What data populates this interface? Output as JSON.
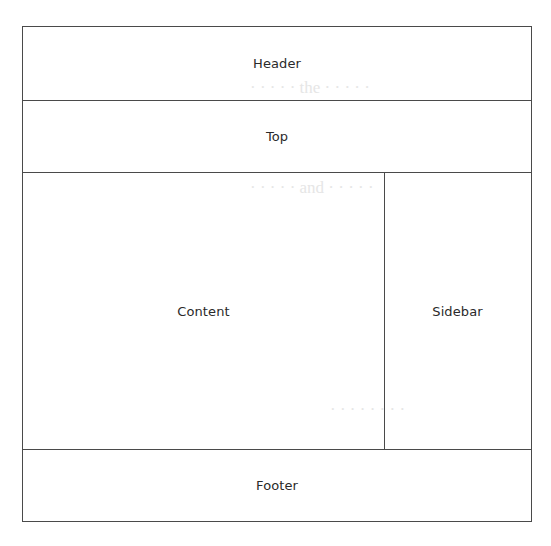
{
  "diagram": {
    "type": "page-layout-wireframe",
    "regions": {
      "header": {
        "label": "Header"
      },
      "top": {
        "label": "Top"
      },
      "content": {
        "label": "Content"
      },
      "sidebar": {
        "label": "Sidebar"
      },
      "footer": {
        "label": "Footer"
      }
    },
    "colors": {
      "border": "#4a4a4a",
      "text": "#2a2a2a",
      "background": "#ffffff"
    }
  }
}
